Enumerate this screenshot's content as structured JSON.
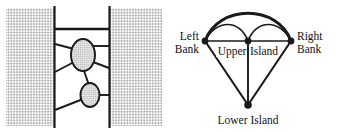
{
  "figure": {
    "ink_color": "#1a1a1a",
    "bank_fill_color": "#d9d9d9",
    "island_fill_color": "#cfcfcf",
    "water_color": "#ffffff",
    "panels": [
      {
        "id": "map",
        "name": "river-map"
      },
      {
        "id": "graph",
        "name": "multigraph"
      }
    ]
  },
  "map": {
    "regions": [
      {
        "name": "left-bank",
        "label": ""
      },
      {
        "name": "right-bank",
        "label": ""
      },
      {
        "name": "river",
        "label": ""
      },
      {
        "name": "upper-island",
        "label": ""
      },
      {
        "name": "lower-island",
        "label": ""
      }
    ],
    "bridges": [
      {
        "name": "top-bridge",
        "from": "left-bank",
        "to": "right-bank"
      },
      {
        "name": "upper-left-bridge-a",
        "from": "left-bank",
        "to": "upper-island"
      },
      {
        "name": "upper-left-bridge-b",
        "from": "left-bank",
        "to": "upper-island"
      },
      {
        "name": "upper-right-bridge",
        "from": "upper-island",
        "to": "right-bank"
      },
      {
        "name": "upper-right-bridge-b",
        "from": "upper-island",
        "to": "right-bank"
      },
      {
        "name": "island-island-bridge",
        "from": "upper-island",
        "to": "lower-island"
      },
      {
        "name": "lower-left-bridge",
        "from": "left-bank",
        "to": "lower-island"
      },
      {
        "name": "lower-right-bridge",
        "from": "lower-island",
        "to": "right-bank"
      }
    ]
  },
  "graph": {
    "nodes": [
      {
        "id": "left-bank",
        "label": "Left\nBank",
        "label_line1": "Left",
        "label_line2": "Bank",
        "x": 37,
        "y": 41
      },
      {
        "id": "right-bank",
        "label": "Right\nBank",
        "label_line1": "Right",
        "label_line2": "Bank",
        "x": 123,
        "y": 41
      },
      {
        "id": "upper-island",
        "label": "Upper Island",
        "label_line1": "Upper",
        "label_line2": "Island",
        "x": 80,
        "y": 41
      },
      {
        "id": "lower-island",
        "label": "Lower Island",
        "label_line1": "Lower Island",
        "label_line2": "",
        "x": 80,
        "y": 105
      }
    ],
    "labels": {
      "left_bank_line1": "Left",
      "left_bank_line2": "Bank",
      "right_bank_line1": "Right",
      "right_bank_line2": "Bank",
      "upper_island_left": "Upper",
      "upper_island_right": "Island",
      "lower_island": "Lower Island"
    },
    "edges": [
      {
        "name": "edge-left-right-arc",
        "from": "left-bank",
        "to": "right-bank",
        "style": "arc-large"
      },
      {
        "name": "edge-left-upper-arc",
        "from": "left-bank",
        "to": "upper-island",
        "style": "arc-small"
      },
      {
        "name": "edge-left-upper-straight",
        "from": "left-bank",
        "to": "upper-island",
        "style": "straight"
      },
      {
        "name": "edge-upper-right-arc",
        "from": "upper-island",
        "to": "right-bank",
        "style": "arc-small"
      },
      {
        "name": "edge-upper-right-straight",
        "from": "upper-island",
        "to": "right-bank",
        "style": "straight"
      },
      {
        "name": "edge-left-lower",
        "from": "left-bank",
        "to": "lower-island",
        "style": "straight"
      },
      {
        "name": "edge-upper-lower",
        "from": "upper-island",
        "to": "lower-island",
        "style": "straight"
      },
      {
        "name": "edge-right-lower",
        "from": "right-bank",
        "to": "lower-island",
        "style": "straight"
      }
    ]
  }
}
